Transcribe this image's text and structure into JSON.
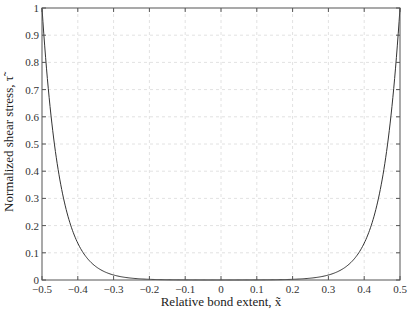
{
  "chart_data": {
    "type": "line",
    "title": "",
    "xlabel": "Relative bond extent, x̃",
    "ylabel": "Normalized shear stress, τ̃",
    "xlim": [
      -0.5,
      0.5
    ],
    "ylim": [
      0,
      1
    ],
    "xticks": [
      -0.5,
      -0.4,
      -0.3,
      -0.2,
      -0.1,
      0,
      0.1,
      0.2,
      0.3,
      0.4,
      0.5
    ],
    "xtick_labels": [
      "-0.5",
      "-0.4",
      "-0.3",
      "-0.2",
      "-0.1",
      "0",
      "0.1",
      "0.2",
      "0.3",
      "0.4",
      "0.5"
    ],
    "yticks": [
      0,
      0.1,
      0.2,
      0.3,
      0.4,
      0.5,
      0.6,
      0.7,
      0.8,
      0.9,
      1
    ],
    "ytick_labels": [
      "0",
      "0.1",
      "0.2",
      "0.3",
      "0.4",
      "0.5",
      "0.6",
      "0.7",
      "0.8",
      "0.9",
      "1"
    ],
    "grid": true,
    "legend": null,
    "series": [
      {
        "name": "shear stress",
        "color": "#333333",
        "x": [
          -0.5,
          -0.48,
          -0.46,
          -0.45,
          -0.44,
          -0.42,
          -0.4,
          -0.38,
          -0.35,
          -0.3,
          -0.25,
          -0.2,
          -0.1,
          0,
          0.1,
          0.2,
          0.25,
          0.3,
          0.35,
          0.38,
          0.4,
          0.42,
          0.44,
          0.45,
          0.46,
          0.48,
          0.5
        ],
        "y": [
          1.0,
          0.67,
          0.449,
          0.368,
          0.301,
          0.202,
          0.135,
          0.091,
          0.05,
          0.018,
          0.007,
          0.002,
          0.0,
          0.0,
          0.0,
          0.002,
          0.007,
          0.018,
          0.05,
          0.091,
          0.135,
          0.202,
          0.301,
          0.368,
          0.449,
          0.67,
          1.0
        ]
      }
    ]
  },
  "labels": {
    "xlabel": "Relative bond extent, x̃",
    "ylabel": "Normalized shear stress, τ̃"
  }
}
